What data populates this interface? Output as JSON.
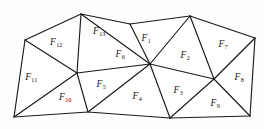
{
  "figure": {
    "type": "triangular-mesh-diagram",
    "stroke_color": "#1a1a1a",
    "fill_color": "#ffffff",
    "background_color": "#fdfdfc",
    "label_color": "#141414"
  },
  "vertices": [
    {
      "id": "v-top-left-outer",
      "x": 25,
      "y": 40
    },
    {
      "id": "v-top-a",
      "x": 81,
      "y": 14
    },
    {
      "id": "v-top-b",
      "x": 130,
      "y": 24
    },
    {
      "id": "v-top-c",
      "x": 190,
      "y": 16
    },
    {
      "id": "v-top-right",
      "x": 255,
      "y": 38
    },
    {
      "id": "v-hub-left",
      "x": 77,
      "y": 73
    },
    {
      "id": "v-hub-center",
      "x": 150,
      "y": 64
    },
    {
      "id": "v-hub-right",
      "x": 214,
      "y": 79
    },
    {
      "id": "v-bottom-left",
      "x": 14,
      "y": 117
    },
    {
      "id": "v-bottom-a",
      "x": 88,
      "y": 112
    },
    {
      "id": "v-bottom-b",
      "x": 170,
      "y": 118
    },
    {
      "id": "v-bottom-right",
      "x": 250,
      "y": 116
    }
  ],
  "edges": [
    {
      "from": "v-top-left-outer",
      "to": "v-top-a"
    },
    {
      "from": "v-top-a",
      "to": "v-top-b"
    },
    {
      "from": "v-top-b",
      "to": "v-top-c"
    },
    {
      "from": "v-top-c",
      "to": "v-top-right"
    },
    {
      "from": "v-top-right",
      "to": "v-bottom-right"
    },
    {
      "from": "v-bottom-right",
      "to": "v-bottom-b"
    },
    {
      "from": "v-bottom-b",
      "to": "v-bottom-a"
    },
    {
      "from": "v-bottom-a",
      "to": "v-bottom-left"
    },
    {
      "from": "v-bottom-left",
      "to": "v-top-left-outer"
    },
    {
      "from": "v-top-left-outer",
      "to": "v-hub-left"
    },
    {
      "from": "v-top-a",
      "to": "v-hub-left"
    },
    {
      "from": "v-top-a",
      "to": "v-hub-center"
    },
    {
      "from": "v-top-b",
      "to": "v-hub-center"
    },
    {
      "from": "v-top-c",
      "to": "v-hub-center"
    },
    {
      "from": "v-top-c",
      "to": "v-hub-right"
    },
    {
      "from": "v-top-right",
      "to": "v-hub-right"
    },
    {
      "from": "v-hub-left",
      "to": "v-hub-center"
    },
    {
      "from": "v-hub-center",
      "to": "v-hub-right"
    },
    {
      "from": "v-hub-left",
      "to": "v-bottom-left"
    },
    {
      "from": "v-hub-left",
      "to": "v-bottom-a"
    },
    {
      "from": "v-hub-center",
      "to": "v-bottom-a"
    },
    {
      "from": "v-hub-center",
      "to": "v-bottom-b"
    },
    {
      "from": "v-hub-right",
      "to": "v-bottom-b"
    },
    {
      "from": "v-hub-right",
      "to": "v-bottom-right"
    }
  ],
  "faces": [
    {
      "name": "F1",
      "symbol": "F",
      "subscript": "1",
      "label_x": 146,
      "label_y": 39,
      "polygon": "v-top-b,v-top-c,v-hub-center"
    },
    {
      "name": "F2",
      "symbol": "F",
      "subscript": "2",
      "label_x": 185,
      "label_y": 56,
      "polygon": "v-top-c,v-hub-right,v-hub-center"
    },
    {
      "name": "F3",
      "symbol": "F",
      "subscript": "3",
      "label_x": 178,
      "label_y": 91,
      "polygon": "v-hub-center,v-hub-right,v-bottom-b"
    },
    {
      "name": "F4",
      "symbol": "F",
      "subscript": "4",
      "label_x": 137,
      "label_y": 97,
      "polygon": "v-hub-center,v-bottom-b,v-bottom-a"
    },
    {
      "name": "F5",
      "symbol": "F",
      "subscript": "5",
      "label_x": 101,
      "label_y": 85,
      "polygon": "v-hub-left,v-hub-center,v-bottom-a"
    },
    {
      "name": "F6",
      "symbol": "F",
      "subscript": "6",
      "label_x": 120,
      "label_y": 55,
      "polygon": "v-top-a,v-top-b,v-hub-center,v-hub-left"
    },
    {
      "name": "F7",
      "symbol": "F",
      "subscript": "7",
      "label_x": 223,
      "label_y": 45,
      "polygon": "v-top-c,v-top-right,v-hub-right"
    },
    {
      "name": "F8",
      "symbol": "F",
      "subscript": "8",
      "label_x": 239,
      "label_y": 78,
      "polygon": "v-hub-right,v-top-right,v-bottom-right"
    },
    {
      "name": "F9",
      "symbol": "F",
      "subscript": "9",
      "label_x": 215,
      "label_y": 104,
      "polygon": "v-hub-right,v-bottom-right,v-bottom-b"
    },
    {
      "name": "F10",
      "symbol": "F",
      "subscript": "10",
      "label_x": 65,
      "label_y": 98,
      "polygon": "v-hub-left,v-bottom-a,v-bottom-left"
    },
    {
      "name": "F11",
      "symbol": "F",
      "subscript": "11",
      "label_x": 31,
      "label_y": 78,
      "polygon": "v-top-left-outer,v-hub-left,v-bottom-left"
    },
    {
      "name": "F12",
      "symbol": "F",
      "subscript": "12",
      "label_x": 56,
      "label_y": 43,
      "polygon": "v-top-left-outer,v-top-a,v-hub-left"
    },
    {
      "name": "F13",
      "symbol": "F",
      "subscript": "13",
      "label_x": 99,
      "label_y": 32,
      "polygon": "v-top-a,v-top-b,v-hub-center"
    }
  ]
}
